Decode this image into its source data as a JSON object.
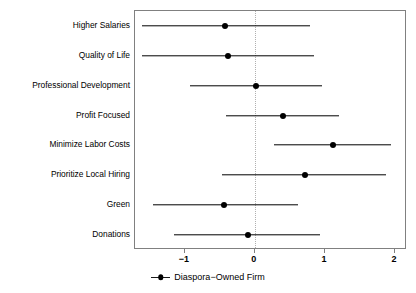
{
  "chart_data": {
    "type": "scatter",
    "title": "",
    "subtitle": "",
    "xlabel": "",
    "ylabel": "",
    "xlim": [
      -1.71,
      2.17
    ],
    "xticks": [
      -1,
      0,
      1,
      2
    ],
    "xtick_labels": [
      "−1",
      "0",
      "1",
      "2"
    ],
    "grid": false,
    "zero_reference_line": 0,
    "legend_position": "bottom-center",
    "legend": [
      {
        "name": "Diaspora−Owned Firm",
        "marker": "point-with-errorbar",
        "color": "#000000"
      }
    ],
    "categories": [
      "Higher Salaries",
      "Quality of Life",
      "Professional Development",
      "Profit Focused",
      "Minimize Labor Costs",
      "Prioritize Local Hiring",
      "Green",
      "Donations"
    ],
    "series": [
      {
        "name": "Diaspora−Owned Firm",
        "color": "#000000",
        "values": [
          -0.43,
          -0.39,
          0.02,
          0.4,
          1.12,
          0.72,
          -0.44,
          -0.1
        ],
        "ci_low": [
          -1.61,
          -1.61,
          -0.92,
          -0.41,
          0.27,
          -0.47,
          -1.45,
          -1.15
        ],
        "ci_high": [
          0.79,
          0.85,
          0.96,
          1.2,
          1.94,
          1.87,
          0.62,
          0.93
        ]
      }
    ],
    "points": [
      {
        "category": "Higher Salaries",
        "estimate": -0.43,
        "ci_low": -1.61,
        "ci_high": 0.79
      },
      {
        "category": "Quality of Life",
        "estimate": -0.39,
        "ci_low": -1.61,
        "ci_high": 0.85
      },
      {
        "category": "Professional Development",
        "estimate": 0.02,
        "ci_low": -0.92,
        "ci_high": 0.96
      },
      {
        "category": "Profit Focused",
        "estimate": 0.4,
        "ci_low": -0.41,
        "ci_high": 1.2
      },
      {
        "category": "Minimize Labor Costs",
        "estimate": 1.12,
        "ci_low": 0.27,
        "ci_high": 1.94
      },
      {
        "category": "Prioritize Local Hiring",
        "estimate": 0.72,
        "ci_low": -0.47,
        "ci_high": 1.87
      },
      {
        "category": "Green",
        "estimate": -0.44,
        "ci_low": -1.45,
        "ci_high": 0.62
      },
      {
        "category": "Donations",
        "estimate": -0.1,
        "ci_low": -1.15,
        "ci_high": 0.93
      }
    ]
  },
  "colors": {
    "point": "#000000",
    "line": "#1a1a1a",
    "frame": "#808080",
    "zero_line": "#b0b0b0",
    "background": "#ffffff"
  }
}
